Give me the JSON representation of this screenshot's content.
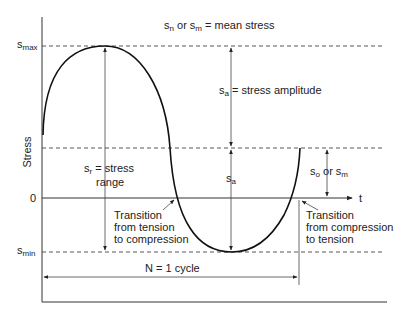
{
  "diagram": {
    "title_line": {
      "s1": "s",
      "s1_sub": "n",
      "or": " or ",
      "s2": "s",
      "s2_sub": "m",
      "rest": " = mean stress"
    },
    "y_axis_label": "Stress",
    "x_axis_label": "t",
    "zero_label": "0",
    "smax": {
      "s": "s",
      "sub": "max"
    },
    "smin": {
      "s": "s",
      "sub": "min"
    },
    "amplitude": {
      "s": "s",
      "sub": "a",
      "rest": " = stress amplitude"
    },
    "amplitude_lower": {
      "s": "s",
      "sub": "a"
    },
    "range": {
      "s": "s",
      "sub": "r",
      "rest": " = stress",
      "line2": "range"
    },
    "mean_right": {
      "s1": "s",
      "s1_sub": "o",
      "or": " or ",
      "s2": "s",
      "s2_sub": "m"
    },
    "transition_tc": [
      "Transition",
      "from tension",
      "to compression"
    ],
    "transition_ct": [
      "Transition",
      "from compression",
      "to tension"
    ],
    "cycle_label": "N = 1 cycle",
    "colors": {
      "line": "#111111",
      "dash": "#444444",
      "text": "#222222",
      "background": "#ffffff"
    }
  }
}
